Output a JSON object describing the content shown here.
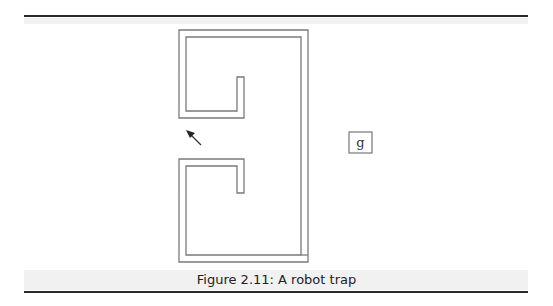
{
  "figure": {
    "caption": "Figure 2.11: A robot trap",
    "goal_label": "g",
    "wall_color": "#7a7a7a",
    "rule_color": "#2a2a2a",
    "elements": {
      "maze": "C-shaped double-line wall with two inward hooks",
      "robot": "arrow pointing up-left at the opening",
      "goal": "boxed letter g outside the trap"
    }
  }
}
